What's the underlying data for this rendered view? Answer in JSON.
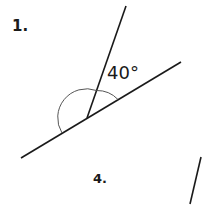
{
  "problems": [
    {
      "number": "1.",
      "angle_label": "40°",
      "given_angle_deg": 40
    },
    {
      "number": "4."
    }
  ],
  "colors": {
    "line": "#1a1a1a",
    "arc": "#555555",
    "background": "#ffffff"
  }
}
